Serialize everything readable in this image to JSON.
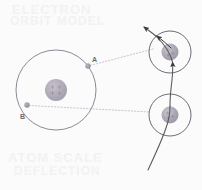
{
  "figure": {
    "background_color": "#fbfbfb",
    "width": 202,
    "height": 190
  },
  "watermark": {
    "top_line1": "ELECTRON",
    "top_line2": "ORBIT MODEL",
    "bottom_line1": "ATOM SCALE",
    "bottom_line2": "DEFLECTION"
  },
  "labels": {
    "point_a": "A",
    "point_b": "B"
  },
  "colors": {
    "orbit_stroke": "#8e8a96",
    "nucleus_fill": "#b5b0bb",
    "nucleus_inner": "#9a94a3",
    "electron_fill": "#a49fae",
    "dotted_line": "#b9b5c0",
    "trajectory": "#58555c",
    "arrow": "#3a3a3a",
    "text": "#6d6d6d",
    "watermark": "#f2f2f2"
  },
  "elements": {
    "main_atom": {
      "name": "main-atom",
      "center_x": 56,
      "center_y": 90,
      "orbit_radius": 40,
      "nucleus_radius": 11,
      "electron_a": {
        "x": 88,
        "y": 66,
        "radius": 2.6
      },
      "electron_b": {
        "x": 27,
        "y": 105,
        "radius": 2.6
      }
    },
    "inset_atom_top": {
      "name": "inset-atom-top",
      "center_x": 170,
      "center_y": 52,
      "orbit_radius": 21,
      "nucleus_radius": 8
    },
    "inset_atom_bottom": {
      "name": "inset-atom-bottom",
      "center_x": 170,
      "center_y": 115,
      "orbit_radius": 21,
      "nucleus_radius": 8
    },
    "connector_a": {
      "name": "connector-line-a",
      "from_x": 90,
      "from_y": 65,
      "to_x": 152,
      "to_y": 50,
      "style": "dotted"
    },
    "connector_b": {
      "name": "connector-line-b",
      "from_x": 29,
      "from_y": 106,
      "to_x": 150,
      "to_y": 112,
      "style": "dotted"
    },
    "trajectory": {
      "name": "particle-trajectory",
      "description": "curved path entering bottom-right, passing through both inset atoms, exiting top-left",
      "arrow_count": 3
    }
  }
}
